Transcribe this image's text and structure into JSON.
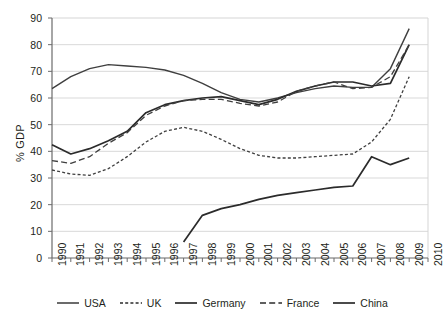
{
  "chart_data": {
    "type": "line",
    "title": "",
    "xlabel": "",
    "ylabel": "% GDP",
    "xlim": [
      1990,
      2010
    ],
    "ylim": [
      0,
      90
    ],
    "ytick_step": 10,
    "grid": true,
    "legend_position": "bottom",
    "x": [
      1990,
      1991,
      1992,
      1993,
      1994,
      1995,
      1996,
      1997,
      1998,
      1999,
      2000,
      2001,
      2002,
      2003,
      2004,
      2005,
      2006,
      2007,
      2008,
      2009,
      2010
    ],
    "categories": [
      "1990",
      "1991",
      "1992",
      "1993",
      "1994",
      "1995",
      "1996",
      "1997",
      "1998",
      "1999",
      "2000",
      "2001",
      "2002",
      "2003",
      "2004",
      "2005",
      "2006",
      "2007",
      "2008",
      "2009",
      "2010"
    ],
    "yticks": [
      0,
      10,
      20,
      30,
      40,
      50,
      60,
      70,
      80,
      90
    ],
    "series": [
      {
        "name": "USA",
        "style": "solid",
        "color": "#3f3f3f",
        "width": 1.4,
        "x": [
          1990,
          1991,
          1992,
          1993,
          1994,
          1995,
          1996,
          1997,
          1998,
          1999,
          2000,
          2001,
          2002,
          2003,
          2004,
          2005,
          2006,
          2007,
          2008,
          2009
        ],
        "values": [
          63.5,
          68.0,
          71.0,
          72.5,
          72.0,
          71.5,
          70.5,
          68.5,
          65.5,
          62.0,
          59.5,
          58.5,
          60.0,
          62.0,
          63.5,
          64.5,
          64.0,
          64.0,
          71.0,
          86.0
        ]
      },
      {
        "name": "UK",
        "style": "dotted",
        "color": "#3f3f3f",
        "width": 1.3,
        "x": [
          1990,
          1991,
          1992,
          1993,
          1994,
          1995,
          1996,
          1997,
          1998,
          1999,
          2000,
          2001,
          2002,
          2003,
          2004,
          2005,
          2006,
          2007,
          2008,
          2009
        ],
        "values": [
          33.0,
          31.5,
          31.0,
          33.5,
          38.0,
          43.5,
          47.5,
          49.0,
          47.5,
          44.5,
          41.0,
          38.5,
          37.5,
          37.5,
          38.0,
          38.5,
          39.0,
          43.5,
          52.0,
          68.0
        ]
      },
      {
        "name": "Germany",
        "style": "solid",
        "color": "#2b2b2b",
        "width": 1.7,
        "x": [
          1990,
          1991,
          1992,
          1993,
          1994,
          1995,
          1996,
          1997,
          1998,
          1999,
          2000,
          2001,
          2002,
          2003,
          2004,
          2005,
          2006,
          2007,
          2008,
          2009
        ],
        "values": [
          42.5,
          39.0,
          41.0,
          44.0,
          47.5,
          54.5,
          57.5,
          59.0,
          60.0,
          60.5,
          59.0,
          57.5,
          59.5,
          62.5,
          64.5,
          66.0,
          66.0,
          64.5,
          65.5,
          80.0
        ]
      },
      {
        "name": "France",
        "style": "dashed",
        "color": "#3f3f3f",
        "width": 1.3,
        "x": [
          1990,
          1991,
          1992,
          1993,
          1994,
          1995,
          1996,
          1997,
          1998,
          1999,
          2000,
          2001,
          2002,
          2003,
          2004,
          2005,
          2006,
          2007,
          2008,
          2009
        ],
        "values": [
          36.5,
          35.5,
          38.0,
          43.0,
          47.0,
          53.5,
          57.0,
          59.0,
          59.5,
          59.5,
          58.0,
          57.0,
          58.5,
          62.5,
          64.5,
          66.0,
          63.5,
          64.0,
          68.0,
          80.0
        ]
      },
      {
        "name": "China",
        "style": "solid",
        "color": "#2b2b2b",
        "width": 1.7,
        "x": [
          1997,
          1998,
          1999,
          2000,
          2001,
          2002,
          2003,
          2004,
          2005,
          2006,
          2007,
          2008,
          2009
        ],
        "values": [
          6.0,
          16.0,
          18.5,
          20.0,
          22.0,
          23.5,
          24.5,
          25.5,
          26.5,
          27.0,
          38.0,
          35.0,
          37.5
        ]
      }
    ],
    "legend": [
      {
        "label": "USA",
        "style": "solid",
        "width": 1.4
      },
      {
        "label": "UK",
        "style": "dotted",
        "width": 1.3
      },
      {
        "label": "Germany",
        "style": "solid",
        "width": 1.7
      },
      {
        "label": "France",
        "style": "dashed",
        "width": 1.3
      },
      {
        "label": "China",
        "style": "solid",
        "width": 1.7
      }
    ],
    "colors": {
      "axis": "#6b6b6b",
      "grid": "#d5d5d5",
      "text": "#231f20",
      "line": "#2b2b2b",
      "background": "#ffffff"
    }
  }
}
